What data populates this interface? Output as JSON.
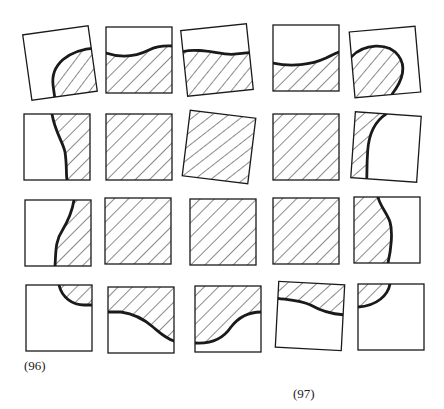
{
  "figure": {
    "stroke_color": "#1a1a1a",
    "hatch_color": "#2a2a2a",
    "background": "#ffffff",
    "labels": [
      {
        "text": "(96)",
        "x": 24,
        "y": 372
      },
      {
        "text": "(97)",
        "x": 293,
        "y": 400
      }
    ],
    "tiles": [
      {
        "row": 1,
        "col": 1,
        "cx": 60,
        "cy": 63,
        "size": 66,
        "rotate": -8,
        "shade": "curve-bottom-right-blob",
        "path": "M38,-10 C10,-12 -10,0 -10,22 L-10,33 L33,33 L33,-14 Z",
        "curve": "M38,-10 C10,-12 -10,0 -10,22 L-10,33"
      },
      {
        "row": 1,
        "col": 2,
        "cx": 139,
        "cy": 60,
        "size": 66,
        "rotate": 0,
        "shade": "below-wave",
        "path": "M-33,-7 C-15,-1 0,-5 10,-10 C20,-15 28,-14 33,-14 L33,33 L-33,33 Z",
        "curve": "M-33,-7 C-15,-1 0,-5 10,-10 C20,-15 28,-14 33,-14"
      },
      {
        "row": 1,
        "col": 3,
        "cx": 217,
        "cy": 60,
        "size": 66,
        "rotate": -6,
        "shade": "below-wave",
        "path": "M-33,-12 C-15,-14 0,-6 15,-4 L33,-4 L33,33 L-33,33 Z",
        "curve": "M-33,-12 C-15,-14 0,-6 15,-4 L33,-4"
      },
      {
        "row": 1,
        "col": 4,
        "cx": 306,
        "cy": 58,
        "size": 66,
        "rotate": 0,
        "shade": "below-wave",
        "path": "M-33,5 C-15,9 5,7 20,0 C26,-3 30,-5 33,-6 L33,33 L-33,33 Z",
        "curve": "M-33,5 C-15,9 5,7 20,0 C26,-3 30,-5 33,-6"
      },
      {
        "row": 1,
        "col": 5,
        "cx": 385,
        "cy": 62,
        "size": 66,
        "rotate": -5,
        "shade": "left-blob",
        "path": "M-33,-8 C-20,-20 5,-20 14,-5 C22,8 14,22 4,33 L-33,33 Z",
        "curve": "M-33,-8 C-20,-20 5,-20 14,-5 C22,8 14,22 4,33"
      },
      {
        "row": 2,
        "col": 1,
        "cx": 57,
        "cy": 147,
        "size": 66,
        "rotate": 0,
        "shade": "right-of-curve",
        "path": "M-5,-33 C-2,-15 6,-5 8,5 C10,18 9,28 10,33 L33,33 L33,-33 Z",
        "curve": "M-5,-33 C-2,-15 6,-5 8,5 C10,18 9,28 10,33"
      },
      {
        "row": 2,
        "col": 2,
        "cx": 139,
        "cy": 147,
        "size": 66,
        "rotate": 0,
        "shade": "full",
        "path": "M-33,-33 L33,-33 L33,33 L-33,33 Z",
        "curve": ""
      },
      {
        "row": 2,
        "col": 3,
        "cx": 219,
        "cy": 147,
        "size": 66,
        "rotate": 7,
        "shade": "full",
        "path": "M-33,-33 L33,-33 L33,33 L-33,33 Z",
        "curve": ""
      },
      {
        "row": 2,
        "col": 4,
        "cx": 306,
        "cy": 147,
        "size": 66,
        "rotate": 0,
        "shade": "full",
        "path": "M-33,-33 L33,-33 L33,33 L-33,33 Z",
        "curve": ""
      },
      {
        "row": 2,
        "col": 5,
        "cx": 386,
        "cy": 147,
        "size": 66,
        "rotate": 4,
        "shade": "left-of-curve",
        "path": "M-33,-33 L-2,-33 C-14,-24 -18,-10 -18,5 C-18,20 -17,28 -17,33 L-33,33 Z",
        "curve": "M-2,-33 C-14,-24 -18,-10 -18,5 C-18,20 -17,28 -17,33"
      },
      {
        "row": 3,
        "col": 1,
        "cx": 58,
        "cy": 233,
        "size": 66,
        "rotate": 0,
        "shade": "right-of-curve",
        "path": "M16,-33 C14,-20 10,-12 4,-2 C-3,8 -2,20 -3,33 L33,33 L33,-33 Z",
        "curve": "M16,-33 C14,-20 10,-12 4,-2 C-3,8 -2,20 -3,33"
      },
      {
        "row": 3,
        "col": 2,
        "cx": 138,
        "cy": 231,
        "size": 66,
        "rotate": 0,
        "shade": "full",
        "path": "M-33,-33 L33,-33 L33,33 L-33,33 Z",
        "curve": ""
      },
      {
        "row": 3,
        "col": 3,
        "cx": 223,
        "cy": 232,
        "size": 66,
        "rotate": 0,
        "shade": "full",
        "path": "M-33,-33 L33,-33 L33,33 L-33,33 Z",
        "curve": ""
      },
      {
        "row": 3,
        "col": 4,
        "cx": 306,
        "cy": 231,
        "size": 66,
        "rotate": 0,
        "shade": "full",
        "path": "M-33,-33 L33,-33 L33,33 L-33,33 Z",
        "curve": ""
      },
      {
        "row": 3,
        "col": 5,
        "cx": 387,
        "cy": 230,
        "size": 66,
        "rotate": 0,
        "shade": "left-of-curve",
        "path": "M-33,-33 L-9,-33 C-7,-24 0,-17 3,-8 C6,2 4,20 1,33 L-33,33 Z",
        "curve": "M-9,-33 C-7,-24 0,-17 3,-8 C6,2 4,20 1,33"
      },
      {
        "row": 4,
        "col": 1,
        "cx": 59,
        "cy": 318,
        "size": 66,
        "rotate": 0,
        "shade": "top-right-corner",
        "path": "M0,-33 C3,-20 14,-13 25,-13 L33,-13 L33,-33 Z",
        "curve": "M0,-33 C3,-20 14,-13 25,-13 L33,-13"
      },
      {
        "row": 4,
        "col": 2,
        "cx": 141,
        "cy": 320,
        "size": 66,
        "rotate": 0,
        "shade": "above-curve",
        "path": "M-33,-33 L33,-33 L33,21 C24,18 18,12 12,7 C4,0 -6,-6 -20,-8 L-33,-8 Z",
        "curve": "M-33,-8 L-20,-8 C-6,-6 4,0 12,7 C18,12 24,18 33,21"
      },
      {
        "row": 4,
        "col": 3,
        "cx": 228,
        "cy": 319,
        "size": 66,
        "rotate": 0,
        "shade": "above-curve",
        "path": "M-33,-33 L33,-33 L33,-7 C20,-7 10,-1 3,8 C-5,20 -18,25 -33,24 Z",
        "curve": "M33,-7 C20,-7 10,-1 3,8 C-5,20 -18,25 -33,24"
      },
      {
        "row": 4,
        "col": 4,
        "cx": 310,
        "cy": 316,
        "size": 66,
        "rotate": 3,
        "shade": "top-band",
        "path": "M-33,-33 L33,-33 L33,-3 C20,-3 10,-6 0,-11 C-10,-15 -22,-15 -33,-16 Z",
        "curve": "M-33,-16 C-22,-15 -10,-15 0,-11 C10,-6 20,-3 33,-3"
      },
      {
        "row": 4,
        "col": 5,
        "cx": 391,
        "cy": 317,
        "size": 66,
        "rotate": 0,
        "shade": "top-left-corner",
        "path": "M-33,-33 L-1,-33 C-3,-22 -14,-11 -33,-10 Z",
        "curve": "M-1,-33 C-3,-22 -14,-11 -33,-10"
      }
    ]
  }
}
